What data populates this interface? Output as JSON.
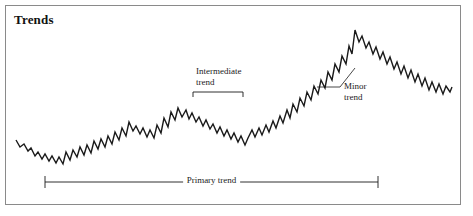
{
  "figure": {
    "title": "Trends",
    "border_color": "#8a8a8a",
    "background_color": "#ffffff",
    "line_color": "#1a1a1a",
    "annotation_color": "#1a1a1a"
  },
  "annotations": {
    "intermediate": {
      "line1": "Intermediate",
      "line2": "trend",
      "full": "Intermediate trend"
    },
    "minor": {
      "line1": "Minor",
      "line2": "trend",
      "full": "Minor trend"
    },
    "primary": {
      "full": "Primary trend"
    }
  },
  "chart_data": {
    "type": "line",
    "title": "Trends",
    "xlabel": "",
    "ylabel": "",
    "grid": false,
    "legend": "none",
    "series": [
      {
        "name": "Price",
        "points": [
          [
            16,
            140
          ],
          [
            20,
            147
          ],
          [
            24,
            144
          ],
          [
            28,
            151
          ],
          [
            31,
            148
          ],
          [
            35,
            156
          ],
          [
            38,
            152
          ],
          [
            42,
            159
          ],
          [
            45,
            154
          ],
          [
            49,
            161
          ],
          [
            52,
            156
          ],
          [
            56,
            163
          ],
          [
            59,
            157
          ],
          [
            63,
            164
          ],
          [
            66,
            152
          ],
          [
            70,
            160
          ],
          [
            73,
            150
          ],
          [
            77,
            157
          ],
          [
            80,
            147
          ],
          [
            84,
            155
          ],
          [
            87,
            145
          ],
          [
            91,
            153
          ],
          [
            94,
            141
          ],
          [
            98,
            149
          ],
          [
            101,
            139
          ],
          [
            105,
            147
          ],
          [
            108,
            136
          ],
          [
            112,
            144
          ],
          [
            115,
            132
          ],
          [
            119,
            140
          ],
          [
            122,
            128
          ],
          [
            126,
            136
          ],
          [
            129,
            122
          ],
          [
            133,
            131
          ],
          [
            136,
            126
          ],
          [
            140,
            134
          ],
          [
            143,
            128
          ],
          [
            147,
            137
          ],
          [
            150,
            130
          ],
          [
            154,
            138
          ],
          [
            157,
            125
          ],
          [
            161,
            133
          ],
          [
            164,
            118
          ],
          [
            168,
            127
          ],
          [
            171,
            112
          ],
          [
            175,
            120
          ],
          [
            178,
            108
          ],
          [
            182,
            117
          ],
          [
            186,
            110
          ],
          [
            189,
            119
          ],
          [
            192,
            113
          ],
          [
            196,
            122
          ],
          [
            199,
            117
          ],
          [
            203,
            126
          ],
          [
            206,
            120
          ],
          [
            210,
            129
          ],
          [
            213,
            124
          ],
          [
            217,
            133
          ],
          [
            220,
            127
          ],
          [
            224,
            136
          ],
          [
            227,
            130
          ],
          [
            231,
            139
          ],
          [
            234,
            133
          ],
          [
            238,
            142
          ],
          [
            241,
            136
          ],
          [
            245,
            145
          ],
          [
            248,
            138
          ],
          [
            252,
            130
          ],
          [
            255,
            137
          ],
          [
            259,
            128
          ],
          [
            262,
            135
          ],
          [
            266,
            125
          ],
          [
            269,
            132
          ],
          [
            273,
            121
          ],
          [
            276,
            128
          ],
          [
            280,
            116
          ],
          [
            283,
            123
          ],
          [
            287,
            110
          ],
          [
            290,
            118
          ],
          [
            293,
            104
          ],
          [
            297,
            112
          ],
          [
            300,
            98
          ],
          [
            304,
            106
          ],
          [
            307,
            92
          ],
          [
            311,
            100
          ],
          [
            314,
            86
          ],
          [
            318,
            94
          ],
          [
            321,
            80
          ],
          [
            325,
            88
          ],
          [
            328,
            72
          ],
          [
            332,
            80
          ],
          [
            335,
            64
          ],
          [
            339,
            72
          ],
          [
            342,
            56
          ],
          [
            346,
            64
          ],
          [
            349,
            46
          ],
          [
            352,
            54
          ],
          [
            355,
            30
          ],
          [
            359,
            42
          ],
          [
            362,
            36
          ],
          [
            366,
            48
          ],
          [
            369,
            42
          ],
          [
            373,
            54
          ],
          [
            376,
            47
          ],
          [
            380,
            59
          ],
          [
            383,
            52
          ],
          [
            387,
            64
          ],
          [
            390,
            57
          ],
          [
            394,
            69
          ],
          [
            397,
            62
          ],
          [
            401,
            74
          ],
          [
            404,
            66
          ],
          [
            408,
            78
          ],
          [
            411,
            70
          ],
          [
            415,
            82
          ],
          [
            418,
            74
          ],
          [
            422,
            86
          ],
          [
            425,
            78
          ],
          [
            429,
            90
          ],
          [
            432,
            82
          ],
          [
            436,
            92
          ],
          [
            439,
            84
          ],
          [
            443,
            94
          ],
          [
            446,
            86
          ],
          [
            450,
            92
          ],
          [
            452,
            87
          ]
        ]
      }
    ],
    "annotations": [
      {
        "id": "intermediate-trend",
        "label": "Intermediate trend",
        "kind": "bracket",
        "orientation": "down",
        "x_start": 193,
        "x_end": 243,
        "y": 92
      },
      {
        "id": "minor-trend",
        "label": "Minor trend",
        "kind": "leader",
        "from_x": 355,
        "from_y": 68,
        "elbow_x": 340,
        "elbow_y": 87,
        "to_x": 317,
        "to_y": 87
      },
      {
        "id": "primary-trend",
        "label": "Primary trend",
        "kind": "span",
        "x_start": 45,
        "x_end": 378,
        "y": 182,
        "tick_half_height": 6
      }
    ]
  }
}
